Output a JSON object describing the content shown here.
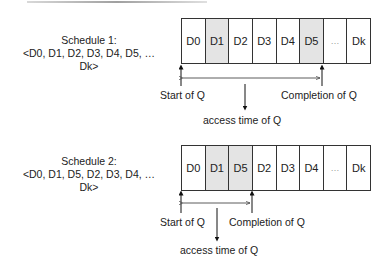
{
  "diagram1": {
    "title": "Schedule 1:",
    "sequence": "<D0, D1, D2, D3, D4, D5, …Dk>",
    "cells": [
      {
        "label": "D0",
        "shaded": false
      },
      {
        "label": "D1",
        "shaded": true
      },
      {
        "label": "D2",
        "shaded": false
      },
      {
        "label": "D3",
        "shaded": false
      },
      {
        "label": "D4",
        "shaded": false
      },
      {
        "label": "D5",
        "shaded": true
      },
      {
        "label": "…",
        "shaded": false
      },
      {
        "label": "Dk",
        "shaded": false
      }
    ],
    "start_label": "Start of Q",
    "completion_label": "Completion of Q",
    "access_label": "access time of Q"
  },
  "diagram2": {
    "title": "Schedule 2:",
    "sequence": "<D0, D1, D5, D2, D3, D4, …Dk>",
    "cells": [
      {
        "label": "D0",
        "shaded": false
      },
      {
        "label": "D1",
        "shaded": true
      },
      {
        "label": "D5",
        "shaded": true
      },
      {
        "label": "D2",
        "shaded": false
      },
      {
        "label": "D3",
        "shaded": false
      },
      {
        "label": "D4",
        "shaded": false
      },
      {
        "label": "…",
        "shaded": false
      },
      {
        "label": "Dk",
        "shaded": false
      }
    ],
    "start_label": "Start of Q",
    "completion_label": "Completion of Q",
    "access_label": "access time of Q"
  }
}
